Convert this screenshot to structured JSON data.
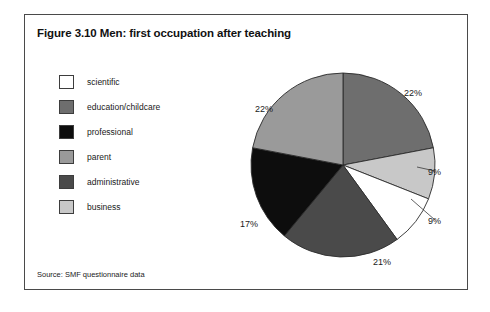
{
  "figure": {
    "title": "Figure 3.10 Men: first occupation after teaching",
    "source": "Source: SMF questionnaire data"
  },
  "legend": {
    "items": [
      {
        "label": "scientific",
        "color": "#ffffff"
      },
      {
        "label": "education/childcare",
        "color": "#6e6e6e"
      },
      {
        "label": "professional",
        "color": "#0d0d0d"
      },
      {
        "label": "parent",
        "color": "#9a9a9a"
      },
      {
        "label": "administrative",
        "color": "#4a4a4a"
      },
      {
        "label": "business",
        "color": "#c8c8c8"
      }
    ]
  },
  "chart_data": {
    "type": "pie",
    "title": "Figure 3.10 Men: first occupation after teaching",
    "xlabel": "",
    "ylabel": "",
    "legend_position": "left",
    "start_angle_deg": 0,
    "direction": "clockwise",
    "units": "percent",
    "categories": [
      "education/childcare",
      "business",
      "scientific",
      "administrative",
      "professional",
      "parent"
    ],
    "values": [
      22,
      9,
      9,
      21,
      17,
      22
    ],
    "colors": [
      "#6e6e6e",
      "#c8c8c8",
      "#ffffff",
      "#4a4a4a",
      "#0d0d0d",
      "#9a9a9a"
    ],
    "labels": [
      "22%",
      "9%",
      "9%",
      "21%",
      "17%",
      "22%"
    ],
    "slices": [
      {
        "category": "education/childcare",
        "value": 22,
        "label": "22%",
        "color": "#6e6e6e"
      },
      {
        "category": "business",
        "value": 9,
        "label": "9%",
        "color": "#c8c8c8"
      },
      {
        "category": "scientific",
        "value": 9,
        "label": "9%",
        "color": "#ffffff"
      },
      {
        "category": "administrative",
        "value": 21,
        "label": "21%",
        "color": "#4a4a4a"
      },
      {
        "category": "professional",
        "value": 17,
        "label": "17%",
        "color": "#0d0d0d"
      },
      {
        "category": "parent",
        "value": 22,
        "label": "22%",
        "color": "#9a9a9a"
      }
    ],
    "label_positions": [
      {
        "label": "22%",
        "x": 183,
        "y": 29
      },
      {
        "label": "9%",
        "x": 207,
        "y": 108
      },
      {
        "label": "9%",
        "x": 207,
        "y": 157
      },
      {
        "label": "21%",
        "x": 152,
        "y": 198
      },
      {
        "label": "17%",
        "x": 19,
        "y": 160
      },
      {
        "label": "22%",
        "x": 34,
        "y": 45
      }
    ]
  }
}
